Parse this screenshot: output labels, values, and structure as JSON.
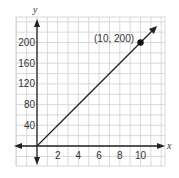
{
  "chart_data": {
    "type": "line",
    "title": "",
    "xlabel": "x",
    "ylabel": "y",
    "x_ticks": [
      2,
      4,
      6,
      8,
      10
    ],
    "y_ticks": [
      40,
      80,
      120,
      160,
      200
    ],
    "xlim": [
      -2,
      12
    ],
    "ylim": [
      -40,
      240
    ],
    "grid": true,
    "series": [
      {
        "name": "line",
        "x": [
          0,
          10,
          11.6
        ],
        "y": [
          0,
          200,
          232
        ]
      }
    ],
    "points": [
      {
        "x": 10,
        "y": 200,
        "label": "(10, 200)"
      }
    ],
    "annotations": [
      "(10, 200)"
    ],
    "colors": {
      "line": "#222222",
      "grid": "#cfcfcf",
      "axis": "#222222",
      "text": "#333333"
    }
  },
  "labels": {
    "x_axis": "x",
    "y_axis": "y",
    "point": "(10, 200)",
    "x_ticks": [
      "2",
      "4",
      "6",
      "8",
      "10"
    ],
    "y_ticks": [
      "40",
      "80",
      "120",
      "160",
      "200"
    ]
  }
}
